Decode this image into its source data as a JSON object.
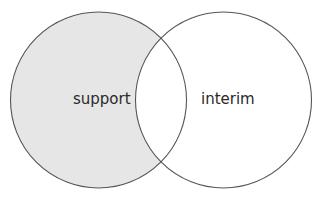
{
  "diagram": {
    "type": "venn",
    "sets": [
      {
        "label": "support",
        "shaded": true,
        "fill": "#e6e6e6"
      },
      {
        "label": "interim",
        "shaded": false,
        "fill": "#ffffff"
      }
    ],
    "intersection_fill": "#ffffff",
    "stroke": "#555555"
  }
}
